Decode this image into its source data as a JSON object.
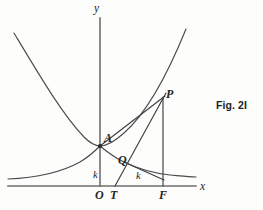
{
  "figure": {
    "caption": "Fig. 2I",
    "caption_position": {
      "x": 216,
      "y": 100
    },
    "background_color": "#fdfdfc",
    "ink_color": "#3f3f42",
    "axis_color": "#6e6e70"
  },
  "axes": {
    "y_axis": {
      "label": "y",
      "label_x": 94,
      "label_y": 3,
      "x": 100,
      "y_top": 18,
      "y_bottom": 186
    },
    "x_axis": {
      "label": "x",
      "label_x": 200,
      "label_y": 181,
      "y": 186,
      "x_left": 8,
      "x_right": 196
    }
  },
  "points": [
    {
      "id": "A",
      "label": "A",
      "x": 100,
      "y": 146,
      "label_x": 104,
      "label_y": 132,
      "dot": true
    },
    {
      "id": "Q",
      "label": "Q",
      "x": 122,
      "y": 158,
      "label_x": 118,
      "label_y": 154,
      "dot": false
    },
    {
      "id": "P",
      "label": "P",
      "x": 163,
      "y": 100,
      "label_x": 166,
      "label_y": 88,
      "dot": false
    },
    {
      "id": "O",
      "label": "O",
      "x": 100,
      "y": 186,
      "label_x": 95,
      "label_y": 189,
      "dot": false
    },
    {
      "id": "T",
      "label": "T",
      "x": 115,
      "y": 186,
      "label_x": 110,
      "label_y": 189,
      "dot": false
    },
    {
      "id": "F",
      "label": "F",
      "x": 163,
      "y": 186,
      "label_x": 159,
      "label_y": 189,
      "dot": false
    }
  ],
  "segment_labels": [
    {
      "id": "k-vertical",
      "label": "k",
      "x": 93,
      "y": 170
    },
    {
      "id": "k-horizontal",
      "label": "k",
      "x": 136,
      "y": 171
    }
  ],
  "curves": [
    {
      "id": "parabola",
      "name": "parabola-curve",
      "description": "upward parabola with vertex at A",
      "path": "M 14 33 C 38 73, 62 114, 84 137 C 91 144, 96 146, 100 146 C 106 146, 114 142, 124 133 C 140 119, 160 93, 186 29"
    },
    {
      "id": "decay-curve",
      "name": "decay-curve",
      "description": "decreasing curve through A and Q asymptotic to the right",
      "path": "M 8 179 C 34 178, 60 173, 80 162 C 90 156, 96 150, 100 146 C 106 151, 112 156, 122 161 C 136 168, 152 173, 170 175 C 181 176, 190 177, 196 177"
    }
  ],
  "construction_lines": [
    {
      "id": "tangent-TP",
      "name": "tangent-line-T-to-P",
      "x1": 115,
      "y1": 186,
      "x2": 166,
      "y2": 93
    },
    {
      "id": "chord-AP",
      "name": "chord-line-A-to-P",
      "x1": 100,
      "y1": 146,
      "x2": 165,
      "y2": 96
    },
    {
      "id": "ordinate-PF",
      "name": "ordinate-line-P-to-F",
      "x1": 163,
      "y1": 97,
      "x2": 163,
      "y2": 186
    },
    {
      "id": "segment-QF",
      "name": "segment-Q-to-F",
      "x1": 124,
      "y1": 162,
      "x2": 164,
      "y2": 180
    }
  ]
}
